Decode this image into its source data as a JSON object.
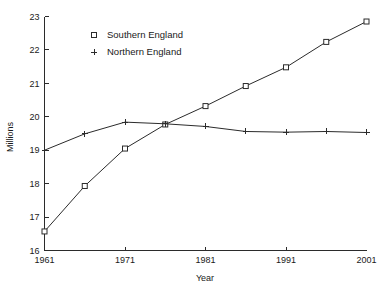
{
  "chart_data": {
    "type": "line",
    "title": "",
    "xlabel": "Year",
    "ylabel": "Millions",
    "xlim": [
      1961,
      2001
    ],
    "ylim": [
      16,
      23
    ],
    "grid": false,
    "legend_position": "upper-left-inside",
    "x": [
      1961,
      1966,
      1971,
      1976,
      1981,
      1986,
      1991,
      1996,
      2001
    ],
    "xtick_labels": [
      "1961",
      "1971",
      "1981",
      "1991",
      "2001"
    ],
    "xticks": [
      1961,
      1971,
      1981,
      1991,
      2001
    ],
    "ytick_labels": [
      "16",
      "17",
      "18",
      "19",
      "20",
      "21",
      "22",
      "23"
    ],
    "yticks": [
      16,
      17,
      18,
      19,
      20,
      21,
      22,
      23
    ],
    "series": [
      {
        "name": "Southern England",
        "marker": "open-square",
        "values": [
          16.57,
          17.93,
          19.05,
          19.77,
          20.32,
          20.92,
          21.48,
          22.24,
          22.85
        ]
      },
      {
        "name": "Northern England",
        "marker": "plus",
        "values": [
          19.0,
          19.49,
          19.84,
          19.79,
          19.71,
          19.56,
          19.54,
          19.56,
          19.53
        ]
      }
    ]
  },
  "legend": {
    "entries": [
      {
        "label": "Southern England",
        "marker": "open-square"
      },
      {
        "label": "Northern England",
        "marker": "plus"
      }
    ]
  },
  "axes": {
    "y_title": "Millions",
    "x_title": "Year"
  }
}
